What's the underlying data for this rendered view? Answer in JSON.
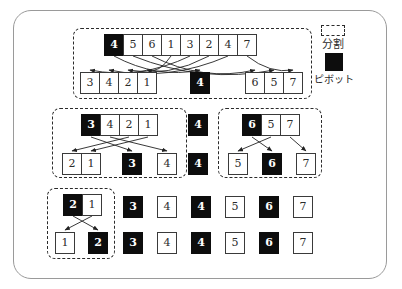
{
  "legend": {
    "partition_label": "分割",
    "pivot_label": "ピボット"
  },
  "colors": {
    "pivot_fill": "#0d0d0d",
    "cell_border": "#3a3a3a",
    "arrow": "#222222",
    "frame_border": "#9a9a9a",
    "dashed_partition": "#2b2b2b"
  },
  "level1": {
    "input": [
      {
        "v": "4",
        "pivot": true
      },
      {
        "v": "5",
        "pivot": false
      },
      {
        "v": "6",
        "pivot": false
      },
      {
        "v": "1",
        "pivot": false
      },
      {
        "v": "3",
        "pivot": false
      },
      {
        "v": "2",
        "pivot": false
      },
      {
        "v": "4",
        "pivot": false
      },
      {
        "v": "7",
        "pivot": false
      }
    ],
    "out_left": [
      {
        "v": "3",
        "pivot": false
      },
      {
        "v": "4",
        "pivot": false
      },
      {
        "v": "2",
        "pivot": false
      },
      {
        "v": "1",
        "pivot": false
      }
    ],
    "out_pivot": {
      "v": "4",
      "pivot": true
    },
    "out_right": [
      {
        "v": "6",
        "pivot": false
      },
      {
        "v": "5",
        "pivot": false
      },
      {
        "v": "7",
        "pivot": false
      }
    ],
    "arrows": [
      "4→4",
      "5→5",
      "6→6",
      "1→1",
      "3→3",
      "2→2",
      "4→4",
      "7→7"
    ]
  },
  "level2": {
    "left": {
      "input": [
        {
          "v": "3",
          "pivot": true
        },
        {
          "v": "4",
          "pivot": false
        },
        {
          "v": "2",
          "pivot": false
        },
        {
          "v": "1",
          "pivot": false
        }
      ],
      "out_left": [
        {
          "v": "2",
          "pivot": false
        },
        {
          "v": "1",
          "pivot": false
        }
      ],
      "out_pivot": {
        "v": "3",
        "pivot": true
      },
      "out_right": [
        {
          "v": "4",
          "pivot": false
        }
      ],
      "arrows": [
        "3→3",
        "4→4",
        "2→2",
        "1→1"
      ]
    },
    "center_pivots": [
      {
        "v": "4",
        "pivot": true
      },
      {
        "v": "4",
        "pivot": true
      }
    ],
    "right": {
      "input": [
        {
          "v": "6",
          "pivot": true
        },
        {
          "v": "5",
          "pivot": false
        },
        {
          "v": "7",
          "pivot": false
        }
      ],
      "out_left": [
        {
          "v": "5",
          "pivot": false
        }
      ],
      "out_pivot": {
        "v": "6",
        "pivot": true
      },
      "out_right": [
        {
          "v": "7",
          "pivot": false
        }
      ],
      "arrows": [
        "6→6",
        "5→5",
        "7→7"
      ]
    }
  },
  "level3": {
    "box": {
      "input": [
        {
          "v": "2",
          "pivot": true
        },
        {
          "v": "1",
          "pivot": false
        }
      ],
      "out": [
        {
          "v": "1",
          "pivot": false
        },
        {
          "v": "2",
          "pivot": true
        }
      ],
      "arrows": [
        "2→2",
        "1→1"
      ]
    },
    "row1": [
      {
        "v": "3",
        "pivot": true
      },
      {
        "v": "4",
        "pivot": false
      },
      {
        "v": "4",
        "pivot": true
      },
      {
        "v": "5",
        "pivot": false
      },
      {
        "v": "6",
        "pivot": true
      },
      {
        "v": "7",
        "pivot": false
      }
    ],
    "row2": [
      {
        "v": "3",
        "pivot": true
      },
      {
        "v": "4",
        "pivot": false
      },
      {
        "v": "4",
        "pivot": true
      },
      {
        "v": "5",
        "pivot": false
      },
      {
        "v": "6",
        "pivot": true
      },
      {
        "v": "7",
        "pivot": false
      }
    ]
  }
}
